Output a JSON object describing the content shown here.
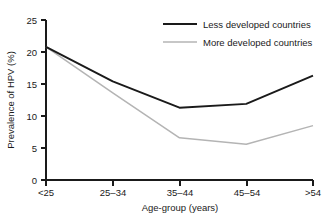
{
  "chart_data": {
    "type": "line",
    "title": "",
    "xlabel": "Age-group (years)",
    "ylabel": "Prevalence of HPV (%)",
    "categories": [
      "<25",
      "25–34",
      "35–44",
      "45–54",
      ">54"
    ],
    "ylim": [
      0,
      25
    ],
    "yticks": [
      0,
      5,
      10,
      15,
      20,
      25
    ],
    "ytick_labels": [
      "0",
      "5",
      "10",
      "15",
      "20",
      "25"
    ],
    "grid": false,
    "legend_position": "top-right",
    "series": [
      {
        "name": "Less developed countries",
        "color": "#1a1a1a",
        "values": [
          20.8,
          15.4,
          11.3,
          11.9,
          16.3
        ]
      },
      {
        "name": "More developed countries",
        "color": "#b4b4b4",
        "values": [
          20.8,
          13.6,
          6.6,
          5.6,
          8.5
        ]
      }
    ]
  },
  "legend": {
    "entries": [
      {
        "label": "Less developed countries"
      },
      {
        "label": "More developed countries"
      }
    ]
  },
  "axes": {
    "y_title": "Prevalence of HPV (%)",
    "x_title": "Age-group (years)",
    "y_tick_labels": [
      "25",
      "20",
      "15",
      "10",
      "5",
      "0"
    ],
    "x_tick_labels": [
      "<25",
      "25–34",
      "35–44",
      "45–54",
      ">54"
    ]
  },
  "colors": {
    "less_developed": "#1a1a1a",
    "more_developed": "#b4b4b4",
    "axis": "#1a1a1a",
    "background": "#ffffff"
  }
}
